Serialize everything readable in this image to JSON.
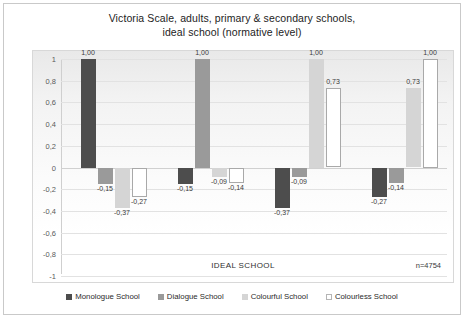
{
  "chart_data": {
    "type": "bar",
    "title": "Victoria Scale, adults, primary & secondary schools, ideal school (normative level)",
    "title_lines": [
      "Victoria Scale, adults, primary & secondary schools,",
      "ideal school (normative level)"
    ],
    "xlabel": "IDEAL SCHOOL",
    "ylabel": "",
    "ylim": [
      -1,
      1
    ],
    "grid": true,
    "legend_position": "bottom",
    "sample_note": "n=4754",
    "categories": [
      "Monologue School",
      "Dialogue School",
      "Colourful School",
      "Colourless School"
    ],
    "tick_labels": [
      "1",
      "0,8",
      "0,6",
      "0,4",
      "0,2",
      "0",
      "-0,2",
      "-0,4",
      "-0,6",
      "-0,8",
      "-1"
    ],
    "tick_values": [
      1,
      0.8,
      0.6,
      0.4,
      0.2,
      0,
      -0.2,
      -0.4,
      -0.6,
      -0.8,
      -1
    ],
    "series": [
      {
        "name": "Monologue School",
        "color": "#4d4d4d",
        "values": [
          1.0,
          -0.15,
          -0.37,
          -0.27
        ],
        "labels": [
          "1,00",
          "-0,15",
          "-0,37",
          "-0,27"
        ]
      },
      {
        "name": "Dialogue School",
        "color": "#9a9a9a",
        "values": [
          -0.15,
          1.0,
          -0.09,
          -0.14
        ],
        "labels": [
          "-0,15",
          "1,00",
          "-0,09",
          "-0,14"
        ]
      },
      {
        "name": "Colourful School",
        "color": "#d5d5d5",
        "values": [
          -0.37,
          -0.09,
          1.0,
          0.73
        ],
        "labels": [
          "-0,37",
          "-0,09",
          "1,00",
          "0,73"
        ]
      },
      {
        "name": "Colourless School",
        "color": "#ffffff",
        "values": [
          -0.27,
          -0.14,
          0.73,
          1.0
        ],
        "labels": [
          "-0,27",
          "-0,14",
          "0,73",
          "1,00"
        ]
      }
    ]
  },
  "caption": ""
}
